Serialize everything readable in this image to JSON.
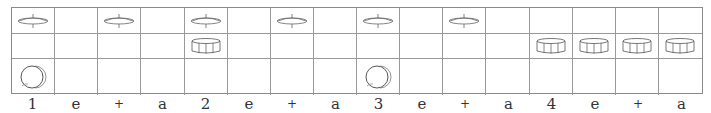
{
  "grid": {
    "columns": 16,
    "rows": [
      {
        "instrument": "hi-hat",
        "icon": "hihat-icon",
        "hits": [
          1,
          0,
          1,
          0,
          1,
          0,
          1,
          0,
          1,
          0,
          1,
          0,
          0,
          0,
          0,
          0
        ]
      },
      {
        "instrument": "snare",
        "icon": "snare-icon",
        "hits": [
          0,
          0,
          0,
          0,
          1,
          0,
          0,
          0,
          0,
          0,
          0,
          0,
          1,
          1,
          1,
          1
        ]
      },
      {
        "instrument": "bass drum",
        "icon": "kick-icon",
        "hits": [
          1,
          0,
          0,
          0,
          0,
          0,
          0,
          0,
          1,
          0,
          0,
          0,
          0,
          0,
          0,
          0
        ]
      }
    ]
  },
  "counts": [
    "1",
    "e",
    "+",
    "a",
    "2",
    "e",
    "+",
    "a",
    "3",
    "e",
    "+",
    "a",
    "4",
    "e",
    "+",
    "a"
  ],
  "colors": {
    "line": "#9a9a9a",
    "icon": "#555555",
    "text": "#333333"
  }
}
